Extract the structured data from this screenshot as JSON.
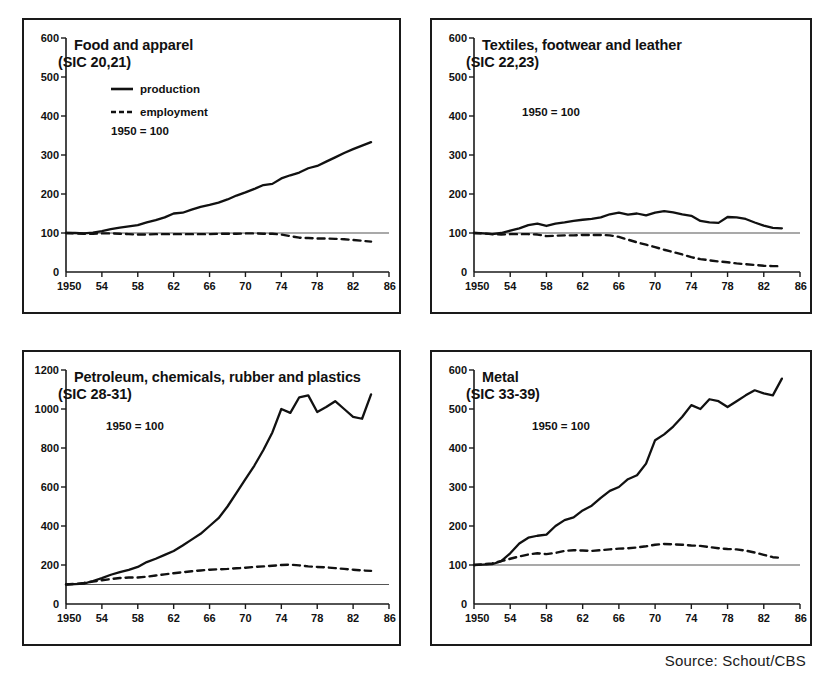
{
  "source_note": "Source: Schout/CBS",
  "legend": {
    "production_label": "production",
    "employment_label": "employment",
    "base_label": "1950 = 100"
  },
  "chart_data": [
    {
      "type": "line",
      "title": "Food and apparel",
      "subtitle": "(SIC 20,21)",
      "xlabel": "",
      "ylabel": "",
      "xlim": [
        1950,
        1986
      ],
      "ylim": [
        0,
        600
      ],
      "xticks": [
        "1950",
        "54",
        "58",
        "62",
        "66",
        "70",
        "74",
        "78",
        "82",
        "86"
      ],
      "xtick_values": [
        1950,
        1954,
        1958,
        1962,
        1966,
        1970,
        1974,
        1978,
        1982,
        1986
      ],
      "yticks": [
        "0",
        "100",
        "200",
        "300",
        "400",
        "500",
        "600"
      ],
      "ytick_values": [
        0,
        100,
        200,
        300,
        400,
        500,
        600
      ],
      "grid": false,
      "reference_line": 100,
      "legend_entries": [
        "production",
        "employment"
      ],
      "legend_position": "top-left",
      "annotations": [
        "1950 = 100"
      ],
      "x": [
        1950,
        1951,
        1952,
        1953,
        1954,
        1955,
        1956,
        1957,
        1958,
        1959,
        1960,
        1961,
        1962,
        1963,
        1964,
        1965,
        1966,
        1967,
        1968,
        1969,
        1970,
        1971,
        1972,
        1973,
        1974,
        1975,
        1976,
        1977,
        1978,
        1979,
        1980,
        1981,
        1982,
        1983,
        1984
      ],
      "series": [
        {
          "name": "production",
          "values": [
            100,
            100,
            99,
            101,
            105,
            110,
            114,
            117,
            120,
            127,
            133,
            140,
            150,
            152,
            160,
            167,
            172,
            178,
            186,
            196,
            204,
            213,
            223,
            226,
            240,
            248,
            255,
            266,
            272,
            283,
            294,
            305,
            315,
            324,
            333
          ]
        },
        {
          "name": "employment",
          "values": [
            100,
            99,
            98,
            98,
            99,
            99,
            98,
            97,
            96,
            96,
            97,
            97,
            97,
            97,
            97,
            97,
            97,
            98,
            98,
            98,
            99,
            99,
            98,
            98,
            96,
            92,
            88,
            87,
            86,
            86,
            85,
            84,
            82,
            80,
            78
          ]
        }
      ]
    },
    {
      "type": "line",
      "title": "Textiles, footwear and leather",
      "subtitle": "(SIC 22,23)",
      "xlabel": "",
      "ylabel": "",
      "xlim": [
        1950,
        1986
      ],
      "ylim": [
        0,
        600
      ],
      "xticks": [
        "1950",
        "54",
        "58",
        "62",
        "66",
        "70",
        "74",
        "78",
        "82",
        "86"
      ],
      "xtick_values": [
        1950,
        1954,
        1958,
        1962,
        1966,
        1970,
        1974,
        1978,
        1982,
        1986
      ],
      "yticks": [
        "0",
        "100",
        "200",
        "300",
        "400",
        "500",
        "600"
      ],
      "ytick_values": [
        0,
        100,
        200,
        300,
        400,
        500,
        600
      ],
      "grid": false,
      "reference_line": 100,
      "legend_entries": [],
      "legend_position": "none",
      "annotations": [
        "1950 = 100"
      ],
      "x": [
        1950,
        1951,
        1952,
        1953,
        1954,
        1955,
        1956,
        1957,
        1958,
        1959,
        1960,
        1961,
        1962,
        1963,
        1964,
        1965,
        1966,
        1967,
        1968,
        1969,
        1970,
        1971,
        1972,
        1973,
        1974,
        1975,
        1976,
        1977,
        1978,
        1979,
        1980,
        1981,
        1982,
        1983,
        1984
      ],
      "series": [
        {
          "name": "production",
          "values": [
            100,
            99,
            97,
            100,
            106,
            112,
            120,
            124,
            118,
            124,
            127,
            131,
            134,
            136,
            140,
            148,
            152,
            147,
            150,
            145,
            152,
            156,
            153,
            148,
            144,
            131,
            127,
            126,
            141,
            140,
            136,
            127,
            119,
            113,
            112
          ]
        },
        {
          "name": "employment",
          "values": [
            100,
            99,
            97,
            96,
            97,
            97,
            97,
            96,
            92,
            93,
            94,
            94,
            95,
            95,
            95,
            94,
            90,
            83,
            76,
            70,
            64,
            57,
            51,
            45,
            38,
            33,
            30,
            27,
            25,
            22,
            20,
            18,
            16,
            15,
            15
          ]
        }
      ]
    },
    {
      "type": "line",
      "title": "Petroleum, chemicals, rubber and plastics",
      "subtitle": "(SIC 28-31)",
      "xlabel": "",
      "ylabel": "",
      "xlim": [
        1950,
        1986
      ],
      "ylim": [
        0,
        1200
      ],
      "xticks": [
        "1950",
        "54",
        "58",
        "62",
        "66",
        "70",
        "74",
        "78",
        "82",
        "86"
      ],
      "xtick_values": [
        1950,
        1954,
        1958,
        1962,
        1966,
        1970,
        1974,
        1978,
        1982,
        1986
      ],
      "yticks": [
        "0",
        "200",
        "400",
        "600",
        "800",
        "1000",
        "1200"
      ],
      "ytick_values": [
        0,
        200,
        400,
        600,
        800,
        1000,
        1200
      ],
      "grid": false,
      "reference_line": 100,
      "legend_entries": [],
      "legend_position": "none",
      "annotations": [
        "1950 = 100"
      ],
      "x": [
        1950,
        1951,
        1952,
        1953,
        1954,
        1955,
        1956,
        1957,
        1958,
        1959,
        1960,
        1961,
        1962,
        1963,
        1964,
        1965,
        1966,
        1967,
        1968,
        1969,
        1970,
        1971,
        1972,
        1973,
        1974,
        1975,
        1976,
        1977,
        1978,
        1979,
        1980,
        1981,
        1982,
        1983,
        1984
      ],
      "series": [
        {
          "name": "production",
          "values": [
            100,
            102,
            105,
            118,
            133,
            150,
            163,
            175,
            190,
            215,
            232,
            252,
            272,
            300,
            330,
            360,
            400,
            440,
            500,
            570,
            640,
            710,
            790,
            880,
            1000,
            980,
            1060,
            1070,
            985,
            1010,
            1040,
            1000,
            960,
            950,
            1075
          ]
        },
        {
          "name": "employment",
          "values": [
            100,
            103,
            108,
            115,
            122,
            128,
            133,
            136,
            136,
            140,
            146,
            152,
            158,
            163,
            168,
            172,
            176,
            178,
            180,
            183,
            186,
            190,
            193,
            196,
            200,
            202,
            198,
            193,
            190,
            188,
            184,
            180,
            176,
            172,
            170
          ]
        }
      ]
    },
    {
      "type": "line",
      "title": "Metal",
      "subtitle": "(SIC 33-39)",
      "xlabel": "",
      "ylabel": "",
      "xlim": [
        1950,
        1986
      ],
      "ylim": [
        0,
        600
      ],
      "xticks": [
        "1950",
        "54",
        "58",
        "62",
        "66",
        "70",
        "74",
        "78",
        "82",
        "86"
      ],
      "xtick_values": [
        1950,
        1954,
        1958,
        1962,
        1966,
        1970,
        1974,
        1978,
        1982,
        1986
      ],
      "yticks": [
        "0",
        "100",
        "200",
        "300",
        "400",
        "500",
        "600"
      ],
      "ytick_values": [
        0,
        100,
        200,
        300,
        400,
        500,
        600
      ],
      "grid": false,
      "reference_line": 100,
      "legend_entries": [],
      "legend_position": "none",
      "annotations": [
        "1950 = 100"
      ],
      "x": [
        1950,
        1951,
        1952,
        1953,
        1954,
        1955,
        1956,
        1957,
        1958,
        1959,
        1960,
        1961,
        1962,
        1963,
        1964,
        1965,
        1966,
        1967,
        1968,
        1969,
        1970,
        1971,
        1972,
        1973,
        1974,
        1975,
        1976,
        1977,
        1978,
        1979,
        1980,
        1981,
        1982,
        1983,
        1984
      ],
      "series": [
        {
          "name": "production",
          "values": [
            100,
            101,
            102,
            110,
            130,
            155,
            170,
            175,
            178,
            200,
            215,
            222,
            240,
            252,
            272,
            290,
            300,
            320,
            330,
            360,
            420,
            435,
            455,
            480,
            510,
            500,
            525,
            520,
            505,
            520,
            535,
            548,
            540,
            535,
            578
          ]
        },
        {
          "name": "employment",
          "values": [
            100,
            102,
            104,
            110,
            116,
            122,
            127,
            130,
            128,
            131,
            136,
            138,
            137,
            136,
            138,
            140,
            142,
            143,
            145,
            148,
            152,
            154,
            153,
            152,
            150,
            149,
            146,
            143,
            141,
            140,
            137,
            132,
            126,
            120,
            118
          ]
        }
      ]
    }
  ]
}
